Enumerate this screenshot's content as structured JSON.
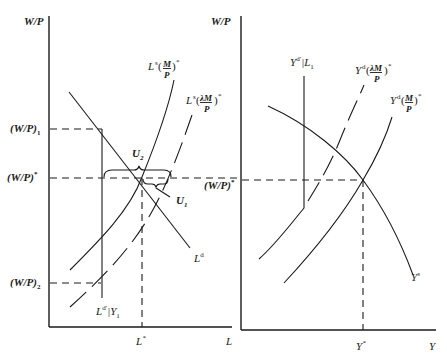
{
  "left_panel": {
    "y_axis_label": "W/P",
    "x_axis_label": "L",
    "y_ticks": {
      "w1": "(W/P)",
      "w1_sub": "1",
      "wstar": "(W/P)",
      "wstar_sup": "*",
      "w2": "(W/P)",
      "w2_sub": "2"
    },
    "x_ticks": {
      "lstar": "L",
      "lstar_sup": "*"
    },
    "curves": {
      "ls_base": "L",
      "ls_sup": "s",
      "ls_frac_num": "M",
      "ls_frac_den": "P",
      "ls_star": "*",
      "ls_lambda_base": "L",
      "ls_lambda_sup": "s",
      "ls_lambda_num": "λM",
      "ls_lambda_den": "P",
      "ls_lambda_star": "*",
      "ld_base": "L",
      "ld_sup": "d",
      "ldprime_base": "L",
      "ldprime_sup": "d′",
      "ldprime_cond": "|Y",
      "ldprime_sub": "1"
    },
    "annotations": {
      "u2_base": "U",
      "u2_sub": "2",
      "u1_base": "U",
      "u1_sub": "1"
    }
  },
  "right_panel": {
    "y_axis_label": "W/P",
    "x_axis_label": "Y",
    "y_ticks": {
      "wstar": "(W/P)",
      "wstar_sup": "*"
    },
    "x_ticks": {
      "ystar": "Y",
      "ystar_sup": "*"
    },
    "curves": {
      "ydprime_base": "Y",
      "ydprime_sup": "d′",
      "ydprime_cond": "|L",
      "ydprime_sub": "1",
      "yd_lambda_base": "Y",
      "yd_lambda_sup": "d",
      "yd_lambda_num": "λM",
      "yd_lambda_den": "P",
      "yd_lambda_star": "*",
      "yd_base": "Y",
      "yd_sup": "d",
      "yd_num": "M",
      "yd_den": "P",
      "yd_star": "*",
      "ys_base": "Y",
      "ys_sup": "s"
    }
  }
}
